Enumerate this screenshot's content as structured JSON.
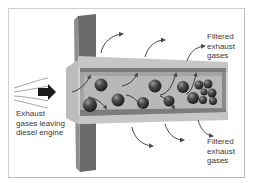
{
  "diagram": {
    "labels": {
      "inlet": [
        "Exhaust",
        "gases leaving",
        "diesel engine"
      ],
      "outlet_top": [
        "Filtered",
        "exhaust",
        "gases"
      ],
      "outlet_bottom": [
        "Filtered",
        "exhaust",
        "gases"
      ]
    },
    "elements": {
      "inflow_lines": 4,
      "inlet_arrow": "black-right-arrow",
      "mounting_plate": "dark-grey-flange",
      "filter_body": "tapered-porous-wall-channel",
      "soot_particles": 17,
      "outflow_arrows_top": 3,
      "outflow_arrows_bottom": 3
    },
    "colors": {
      "plate_dark": "#5a5a5a",
      "plate_light": "#8a8a8a",
      "wall": "#c9c9c9",
      "channel": "#a8a8a8",
      "inner": "#bdbdbd",
      "particle": "#3d3d3d",
      "arrow": "#4a4a4a",
      "text": "#3a3a3a",
      "frame": "#cfcfcf"
    }
  }
}
